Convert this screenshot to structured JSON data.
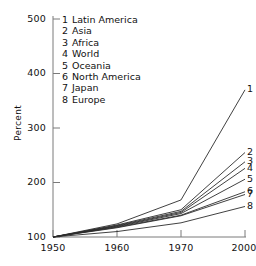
{
  "chart_data": {
    "type": "line",
    "title": "",
    "subtitle": "",
    "xlabel": "",
    "ylabel": "Percent",
    "x": [
      1950,
      1960,
      1970,
      2000
    ],
    "xtick_labels": [
      "1950",
      "1960",
      "1970",
      "2000"
    ],
    "ytick_labels": [
      "100",
      "200",
      "300",
      "400",
      "500"
    ],
    "yticks": [
      100,
      200,
      300,
      400,
      500
    ],
    "xlim": [
      1950,
      2000
    ],
    "ylim": [
      100,
      500
    ],
    "grid": false,
    "legend_position": "upper-left-inside",
    "note": "x axis is non-linear: 1950, 1960, 1970 evenly spaced then 2000",
    "series": [
      {
        "key": "1",
        "name": "Latin America",
        "values": [
          100,
          124,
          168,
          370
        ]
      },
      {
        "key": "2",
        "name": "Asia",
        "values": [
          100,
          122,
          150,
          255
        ]
      },
      {
        "key": "3",
        "name": "Africa",
        "values": [
          100,
          121,
          147,
          238
        ]
      },
      {
        "key": "4",
        "name": "World",
        "values": [
          100,
          120,
          145,
          226
        ]
      },
      {
        "key": "5",
        "name": "Oceania",
        "values": [
          100,
          119,
          143,
          206
        ]
      },
      {
        "key": "6",
        "name": "North America",
        "values": [
          100,
          118,
          140,
          183
        ]
      },
      {
        "key": "7",
        "name": "Japan",
        "values": [
          100,
          117,
          139,
          178
        ]
      },
      {
        "key": "8",
        "name": "Europe",
        "values": [
          100,
          110,
          126,
          156
        ]
      }
    ]
  },
  "axis": {
    "ylabel": "Percent",
    "yticks": [
      {
        "label": "500",
        "value": 500
      },
      {
        "label": "400",
        "value": 400
      },
      {
        "label": "300",
        "value": 300
      },
      {
        "label": "200",
        "value": 200
      },
      {
        "label": "100",
        "value": 100
      }
    ],
    "xticks": [
      {
        "label": "1950",
        "value": 1950
      },
      {
        "label": "1960",
        "value": 1960
      },
      {
        "label": "1970",
        "value": 1970
      },
      {
        "label": "2000",
        "value": 2000
      }
    ]
  },
  "legend": {
    "items": [
      {
        "key": "1",
        "label": "Latin America"
      },
      {
        "key": "2",
        "label": "Asia"
      },
      {
        "key": "3",
        "label": "Africa"
      },
      {
        "key": "4",
        "label": "World"
      },
      {
        "key": "5",
        "label": "Oceania"
      },
      {
        "key": "6",
        "label": "North America"
      },
      {
        "key": "7",
        "label": "Japan"
      },
      {
        "key": "8",
        "label": "Europe"
      }
    ]
  },
  "series_end_labels": [
    {
      "key": "1"
    },
    {
      "key": "2"
    },
    {
      "key": "3"
    },
    {
      "key": "4"
    },
    {
      "key": "5"
    },
    {
      "key": "6"
    },
    {
      "key": "7"
    },
    {
      "key": "8"
    }
  ],
  "colors": {
    "line": "#2b2b2b",
    "axis": "#6f6f6f",
    "text": "#111111",
    "background": "#ffffff"
  }
}
